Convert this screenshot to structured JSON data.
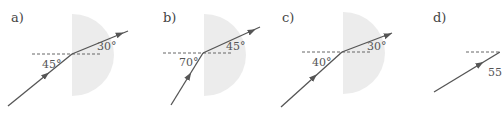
{
  "colors": {
    "ray": "#555555",
    "block": "#ececec",
    "normal": "#666666",
    "background": "#ffffff"
  },
  "panels": [
    {
      "label": "a)",
      "incident_angle": "45°",
      "refracted_angle": "30°"
    },
    {
      "label": "b)",
      "incident_angle": "70°",
      "refracted_angle": "45°"
    },
    {
      "label": "c)",
      "incident_angle": "40°",
      "refracted_angle": "30°"
    },
    {
      "label": "d)",
      "incident_angle": "55"
    }
  ]
}
